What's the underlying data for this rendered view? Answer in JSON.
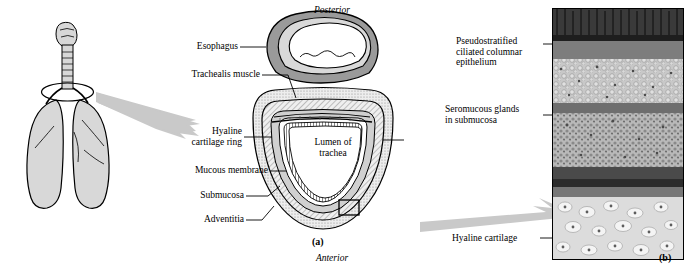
{
  "figure": {
    "panel_a_letter": "(a)",
    "panel_b_letter": "(b)",
    "orientation_top": "Posterior",
    "orientation_bottom": "Anterior"
  },
  "labels_left": [
    {
      "id": "esophagus",
      "text": "Esophagus"
    },
    {
      "id": "trachealis-muscle",
      "text": "Trachealis muscle"
    },
    {
      "id": "hyaline-cartilage-ring",
      "text": "Hyaline\ncartilage ring"
    },
    {
      "id": "mucous-membrane",
      "text": "Mucous membrane"
    },
    {
      "id": "submucosa",
      "text": "Submucosa"
    },
    {
      "id": "adventitia",
      "text": "Adventitia"
    }
  ],
  "labels_center": [
    {
      "id": "lumen-of-trachea",
      "text": "Lumen of\ntrachea"
    }
  ],
  "labels_right": [
    {
      "id": "pseudostratified-epithelium",
      "text": "Pseudostratified\nciliated columnar\nepithelium"
    },
    {
      "id": "seromucous-glands",
      "text": "Seromucous glands\nin submucosa"
    },
    {
      "id": "hyaline-cartilage",
      "text": "Hyaline cartilage"
    }
  ],
  "colors": {
    "outline": "#000000",
    "arrow_gray": "#c9c9c9",
    "cartilage_fill": "#e8e8e8",
    "esophagus_fill": "#9a9a9a",
    "lung_fill": "#d8d8d8",
    "submucosa_fill": "#d0d0d0",
    "micrograph_dark": "#3a3a3a",
    "micrograph_mid": "#8d8d8d",
    "micrograph_light": "#cfcfcf"
  }
}
